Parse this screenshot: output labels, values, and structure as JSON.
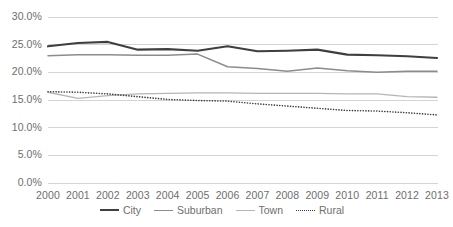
{
  "chart_data": {
    "type": "line",
    "title": "",
    "xlabel": "",
    "ylabel": "",
    "categories": [
      "2000",
      "2001",
      "2002",
      "2003",
      "2004",
      "2005",
      "2006",
      "2007",
      "2008",
      "2009",
      "2010",
      "2011",
      "2012",
      "2013"
    ],
    "ylim": [
      0,
      30
    ],
    "ytick_labels": [
      "30.0%",
      "25.0%",
      "20.0%",
      "15.0%",
      "10.0%",
      "5.0%",
      "0.0%"
    ],
    "ytick_values": [
      30,
      25,
      20,
      15,
      10,
      5,
      0
    ],
    "grid": true,
    "grid_axis": "y",
    "legend_position": "bottom",
    "series": [
      {
        "name": "City",
        "style": "solid",
        "color": "#3f3f3f",
        "width": 2.1,
        "values": [
          24.7,
          25.3,
          25.5,
          24.1,
          24.2,
          23.9,
          24.7,
          23.8,
          23.9,
          24.1,
          23.2,
          23.1,
          22.9,
          22.6
        ]
      },
      {
        "name": "Suburban",
        "style": "solid",
        "color": "#8c8c8c",
        "width": 1.5,
        "values": [
          23.0,
          23.2,
          23.2,
          23.1,
          23.1,
          23.3,
          21.0,
          20.7,
          20.2,
          20.8,
          20.3,
          20.0,
          20.2,
          20.2
        ]
      },
      {
        "name": "Town",
        "style": "solid",
        "color": "#b5b5b5",
        "width": 1.3,
        "values": [
          16.4,
          15.3,
          15.8,
          16.1,
          16.2,
          16.3,
          16.3,
          16.2,
          16.2,
          16.2,
          16.1,
          16.1,
          15.6,
          15.5
        ]
      },
      {
        "name": "Rural",
        "style": "dotted",
        "color": "#3f3f3f",
        "width": 1.6,
        "values": [
          16.5,
          16.4,
          16.1,
          15.6,
          15.1,
          14.9,
          14.8,
          14.3,
          13.9,
          13.5,
          13.1,
          13.0,
          12.7,
          12.3
        ]
      }
    ]
  },
  "axis": {
    "x_left": 48,
    "x_right": 437,
    "y_top": 17,
    "y_bottom": 183
  },
  "colors": {
    "background": "#ffffff",
    "gridline": "#d4d4d4",
    "tick_text": "#6e6e6e"
  }
}
